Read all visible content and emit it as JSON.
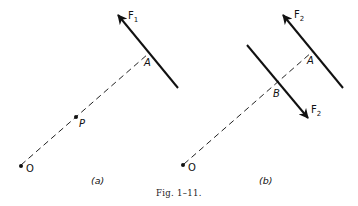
{
  "figure": {
    "caption": "Fig. 1–11.",
    "panels": [
      {
        "id": "a",
        "label": "(a)",
        "points": {
          "O": {
            "label": "O"
          },
          "P": {
            "label": "P"
          },
          "A": {
            "label": "A"
          }
        },
        "forces": [
          {
            "name": "F",
            "subscript": "1",
            "direction": "up-left"
          }
        ]
      },
      {
        "id": "b",
        "label": "(b)",
        "points": {
          "O": {
            "label": "O"
          },
          "A": {
            "label": "A"
          },
          "B": {
            "label": "B"
          }
        },
        "forces": [
          {
            "name": "F",
            "subscript": "2",
            "direction": "up-left"
          },
          {
            "name": "F",
            "subscript": "2",
            "direction": "down-right"
          }
        ]
      }
    ]
  },
  "colors": {
    "ink": "#111111",
    "background": "#ffffff"
  }
}
